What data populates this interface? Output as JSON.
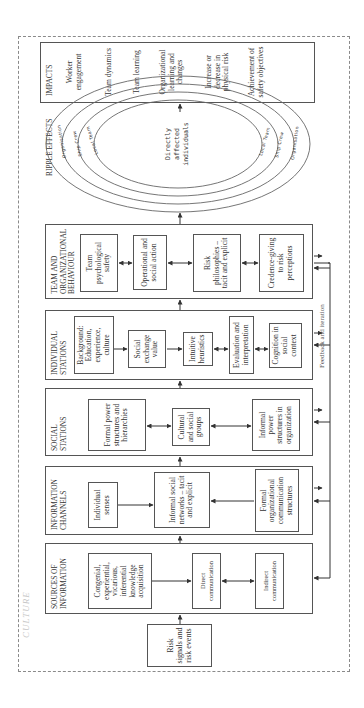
{
  "frame": {
    "culture_label": "CULTURE"
  },
  "risk_signals": {
    "label": "Risk signals and risk events"
  },
  "sections": [
    {
      "id": "sources",
      "title": "SOURCES OF INFORMATION",
      "boxes": [
        {
          "label": "Congenial, experiential, vicarious, inferential knowledge acquisition"
        },
        {
          "label": "Direct communication"
        },
        {
          "label": "Indirect communication"
        }
      ]
    },
    {
      "id": "channels",
      "title": "INFORMATION CHANNELS",
      "boxes": [
        {
          "label": "Individual senses"
        },
        {
          "label": "Informal social networks – tacit and explicit"
        },
        {
          "label": "Formal organizational communication structures"
        }
      ]
    },
    {
      "id": "social",
      "title": "SOCIAL STATIONS",
      "boxes": [
        {
          "label": "Formal power structures and hierarchies"
        },
        {
          "label": "Cultural and social groups"
        },
        {
          "label": "Informal power structures in organization"
        }
      ]
    },
    {
      "id": "individual",
      "title": "INDIVIDUAL STATIONS",
      "boxes": [
        {
          "label": "Background: Education, experience, culture"
        },
        {
          "label": "Social exchange value"
        },
        {
          "label": "Intuitive heuristics"
        },
        {
          "label": "Evaluation and interpretation"
        },
        {
          "label": "Cognition in social context"
        }
      ]
    },
    {
      "id": "team",
      "title": "TEAM AND ORGANIZATIONAL BEHAVIOUR",
      "boxes": [
        {
          "label": "Team psychological safety"
        },
        {
          "label": "Operational and social action"
        },
        {
          "label": "Risk philosophies – tacit and explicit"
        },
        {
          "label": "Credence-giving to risk perceptions"
        }
      ]
    }
  ],
  "ripple": {
    "title": "RIPPLE EFFECTS",
    "center": [
      "Directly",
      "affected",
      "individuals"
    ],
    "rings": [
      "Local Team",
      "Ship Crew",
      "Organisation"
    ]
  },
  "impacts": {
    "title": "IMPACTS",
    "items": [
      "Worker engagement",
      "Team dynamics",
      "Team learning",
      "Organizational learning and changes",
      "Increase or decrease in physical risk",
      "Achievement of safety objectives"
    ]
  },
  "feedback": {
    "label": "Feedback and iteration"
  },
  "colors": {
    "line": "#555555",
    "dashed_frame": "#8a8a8a",
    "culture_text": "#c8c8c8"
  }
}
